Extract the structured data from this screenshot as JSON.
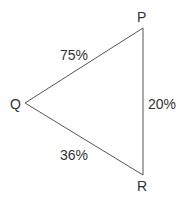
{
  "diagram": {
    "type": "triangle",
    "vertices": [
      {
        "id": "P",
        "label": "P"
      },
      {
        "id": "Q",
        "label": "Q"
      },
      {
        "id": "R",
        "label": "R"
      }
    ],
    "edges": [
      {
        "from": "Q",
        "to": "P",
        "label": "75%"
      },
      {
        "from": "P",
        "to": "R",
        "label": "20%"
      },
      {
        "from": "Q",
        "to": "R",
        "label": "36%"
      }
    ],
    "line_color": "#555555",
    "text_color": "#333333"
  }
}
